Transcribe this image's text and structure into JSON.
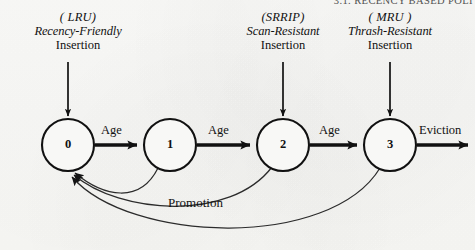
{
  "page": {
    "running_head": "3.1. RECENCY BASED POLI",
    "background_color": "#f7f7f5",
    "ink_color": "#111111"
  },
  "insertion_points": [
    {
      "id": "lru",
      "paren": "( LRU)",
      "policy": "Recency-Friendly",
      "word": "Insertion",
      "target_state": "0"
    },
    {
      "id": "srrip",
      "paren": "(SRRIP)",
      "policy": "Scan-Resistant",
      "word": "Insertion",
      "target_state": "2"
    },
    {
      "id": "mru",
      "paren": "( MRU )",
      "policy": "Thrash-Resistant",
      "word": "Insertion",
      "target_state": "3"
    }
  ],
  "states": [
    {
      "label": "0",
      "cx": 68,
      "cy": 145,
      "r": 26
    },
    {
      "label": "1",
      "cx": 170,
      "cy": 145,
      "r": 26
    },
    {
      "label": "2",
      "cx": 283,
      "cy": 145,
      "r": 26
    },
    {
      "label": "3",
      "cx": 390,
      "cy": 145,
      "r": 26
    }
  ],
  "transitions": [
    {
      "id": "age-0-1",
      "label": "Age",
      "from": "0",
      "to": "1"
    },
    {
      "id": "age-1-2",
      "label": "Age",
      "from": "1",
      "to": "2"
    },
    {
      "id": "age-2-3",
      "label": "Age",
      "from": "2",
      "to": "3"
    },
    {
      "id": "eviction",
      "label": "Eviction",
      "from": "3",
      "to": "out"
    }
  ],
  "promotions": {
    "label": "Promotion",
    "edges": [
      {
        "id": "promo-1-0",
        "from": "1",
        "to": "0"
      },
      {
        "id": "promo-2-0",
        "from": "2",
        "to": "0"
      },
      {
        "id": "promo-3-0",
        "from": "3",
        "to": "0"
      }
    ]
  }
}
